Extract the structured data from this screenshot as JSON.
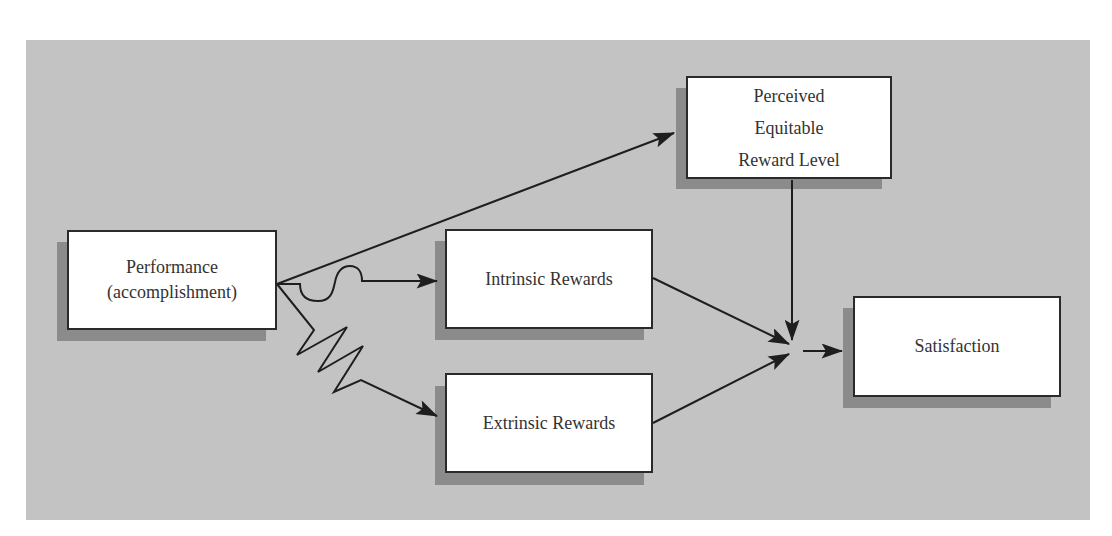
{
  "diagram": {
    "type": "flow",
    "background_color": "#c3c3c3",
    "nodes": {
      "performance": {
        "label": "Performance\n(accomplishment)"
      },
      "intrinsic": {
        "label": "Intrinsic Rewards"
      },
      "extrinsic": {
        "label": "Extrinsic Rewards"
      },
      "perceived": {
        "label": "Perceived\nEquitable\nReward Level"
      },
      "satisfaction": {
        "label": "Satisfaction"
      }
    },
    "edges": [
      {
        "from": "Performance (accomplishment)",
        "to": "Perceived Equitable Reward Level",
        "style": "straight-arrow"
      },
      {
        "from": "Performance (accomplishment)",
        "to": "Intrinsic Rewards",
        "style": "wavy-arrow"
      },
      {
        "from": "Performance (accomplishment)",
        "to": "Extrinsic Rewards",
        "style": "zigzag-arrow"
      },
      {
        "from": "Intrinsic Rewards",
        "to": "convergence",
        "style": "straight-arrow"
      },
      {
        "from": "Extrinsic Rewards",
        "to": "convergence",
        "style": "straight-arrow"
      },
      {
        "from": "Perceived Equitable Reward Level",
        "to": "convergence",
        "style": "straight-arrow"
      },
      {
        "from": "convergence",
        "to": "Satisfaction",
        "style": "straight-arrow"
      }
    ]
  }
}
